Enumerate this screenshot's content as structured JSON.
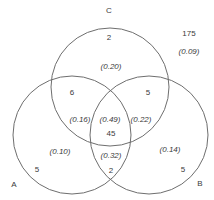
{
  "diagram": {
    "type": "venn-3",
    "sets": [
      {
        "name": "A",
        "label": "A"
      },
      {
        "name": "B",
        "label": "B"
      },
      {
        "name": "C",
        "label": "C"
      }
    ],
    "regions": {
      "c_only": {
        "count": "2",
        "proportion": "(0.20)"
      },
      "a_c": {
        "count": "6",
        "proportion": "(0.16)"
      },
      "b_c": {
        "count": "5",
        "proportion": "(0.22)"
      },
      "a_b_c": {
        "count": "45",
        "proportion": "(0.49)"
      },
      "a_only": {
        "count": "5",
        "proportion": "(0.10)"
      },
      "a_b": {
        "count": "2",
        "proportion": "(0.32)"
      },
      "b_only": {
        "count": "5",
        "proportion": "(0.14)"
      },
      "outside": {
        "count": "175",
        "proportion": "(0.09)"
      }
    },
    "colors": {
      "stroke": "#6e6e6e",
      "text": "#3a3a3a",
      "background": "#ffffff"
    }
  }
}
